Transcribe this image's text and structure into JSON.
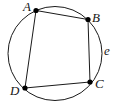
{
  "figure": {
    "type": "geometry-diagram",
    "width": 124,
    "height": 109,
    "background_color": "#ffffff",
    "stroke_color": "#1a1a1a",
    "point_fill_color": "#000000",
    "circle": {
      "name": "circumscribed-circle",
      "label": "e",
      "center_x": 55,
      "center_y": 53.5,
      "radius": 47,
      "stroke_width": 1
    },
    "circle_label": {
      "text": "e",
      "x": 104,
      "y": 44
    },
    "points": [
      {
        "id": "A",
        "label": "A",
        "x": 36,
        "y": 10.5,
        "radius": 2.6,
        "label_x": 23,
        "label_y": 0
      },
      {
        "id": "B",
        "label": "B",
        "x": 88,
        "y": 19.5,
        "radius": 2.6,
        "label_x": 92,
        "label_y": 11
      },
      {
        "id": "C",
        "label": "C",
        "x": 90,
        "y": 82,
        "radius": 2.6,
        "label_x": 95,
        "label_y": 77
      },
      {
        "id": "D",
        "label": "D",
        "x": 25,
        "y": 88,
        "radius": 2.6,
        "label_x": 10,
        "label_y": 84
      }
    ],
    "edges": [
      {
        "id": "AB",
        "from": "A",
        "to": "B",
        "x1": 36,
        "y1": 10.5,
        "x2": 88,
        "y2": 19.5
      },
      {
        "id": "BC",
        "from": "B",
        "to": "C",
        "x1": 88,
        "y1": 19.5,
        "x2": 90,
        "y2": 82
      },
      {
        "id": "CD",
        "from": "C",
        "to": "D",
        "x1": 90,
        "y1": 82,
        "x2": 25,
        "y2": 88
      },
      {
        "id": "DA",
        "from": "D",
        "to": "A",
        "x1": 25,
        "y1": 88,
        "x2": 36,
        "y2": 10.5
      }
    ]
  }
}
